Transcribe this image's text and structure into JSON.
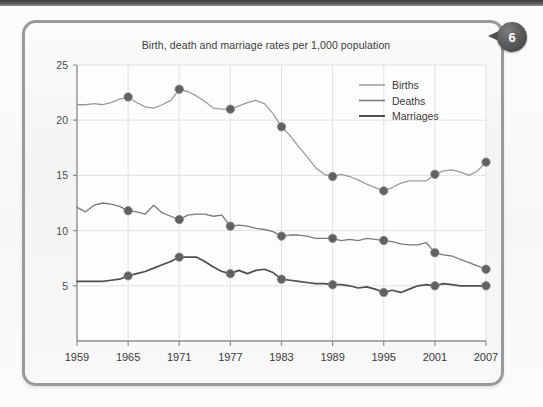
{
  "page": {
    "badge_number": "6",
    "badge_name": "figure-number-badge"
  },
  "chart_data": {
    "type": "line",
    "title": "Birth, death and marriage rates per 1,000 population",
    "xlabel": "",
    "ylabel": "",
    "xlim": [
      1959,
      2007
    ],
    "ylim": [
      0,
      25
    ],
    "yticks": [
      5,
      10,
      15,
      20,
      25
    ],
    "xticks": [
      1959,
      1965,
      1971,
      1977,
      1983,
      1989,
      1995,
      2001,
      2007
    ],
    "grid": true,
    "legend_position": "top-right",
    "marker_years": [
      1965,
      1971,
      1977,
      1983,
      1989,
      1995,
      2001,
      2007
    ],
    "colors": {
      "births": "#9b9b9b",
      "deaths": "#7a7a7a",
      "marriages": "#4f4f4f",
      "marker": "#616161",
      "grid": "#e2e2e2",
      "axis": "#8f8f8f"
    },
    "series": [
      {
        "name": "Births",
        "key": "births",
        "x": [
          1959,
          1960,
          1961,
          1962,
          1963,
          1964,
          1965,
          1966,
          1967,
          1968,
          1969,
          1970,
          1971,
          1972,
          1973,
          1974,
          1975,
          1976,
          1977,
          1978,
          1979,
          1980,
          1981,
          1982,
          1983,
          1984,
          1985,
          1986,
          1987,
          1988,
          1989,
          1990,
          1991,
          1992,
          1993,
          1994,
          1995,
          1996,
          1997,
          1998,
          1999,
          2000,
          2001,
          2002,
          2003,
          2004,
          2005,
          2006,
          2007
        ],
        "values": [
          21.4,
          21.4,
          21.5,
          21.4,
          21.6,
          21.9,
          22.1,
          21.6,
          21.2,
          21.1,
          21.4,
          21.8,
          22.8,
          22.6,
          22.2,
          21.7,
          21.1,
          21.0,
          21.0,
          21.3,
          21.6,
          21.8,
          21.5,
          20.6,
          19.4,
          18.6,
          17.6,
          16.7,
          15.7,
          15.1,
          14.9,
          15.1,
          14.9,
          14.6,
          14.2,
          13.9,
          13.6,
          13.9,
          14.3,
          14.5,
          14.5,
          14.5,
          15.1,
          15.4,
          15.5,
          15.3,
          15.0,
          15.4,
          16.2
        ]
      },
      {
        "name": "Deaths",
        "key": "deaths",
        "x": [
          1959,
          1960,
          1961,
          1962,
          1963,
          1964,
          1965,
          1966,
          1967,
          1968,
          1969,
          1970,
          1971,
          1972,
          1973,
          1974,
          1975,
          1976,
          1977,
          1978,
          1979,
          1980,
          1981,
          1982,
          1983,
          1984,
          1985,
          1986,
          1987,
          1988,
          1989,
          1990,
          1991,
          1992,
          1993,
          1994,
          1995,
          1996,
          1997,
          1998,
          1999,
          2000,
          2001,
          2002,
          2003,
          2004,
          2005,
          2006,
          2007
        ],
        "values": [
          12.1,
          11.7,
          12.3,
          12.5,
          12.4,
          12.2,
          11.8,
          11.7,
          11.5,
          12.3,
          11.6,
          11.3,
          11.0,
          11.4,
          11.5,
          11.5,
          11.3,
          11.4,
          10.4,
          10.5,
          10.4,
          10.2,
          10.1,
          9.9,
          9.5,
          9.6,
          9.6,
          9.5,
          9.3,
          9.3,
          9.3,
          9.1,
          9.2,
          9.1,
          9.3,
          9.2,
          9.1,
          9.0,
          8.8,
          8.7,
          8.7,
          8.9,
          8.0,
          7.8,
          7.7,
          7.4,
          7.1,
          6.8,
          6.5
        ]
      },
      {
        "name": "Marriages",
        "key": "marriages",
        "x": [
          1959,
          1960,
          1961,
          1962,
          1963,
          1964,
          1965,
          1966,
          1967,
          1968,
          1969,
          1970,
          1971,
          1972,
          1973,
          1974,
          1975,
          1976,
          1977,
          1978,
          1979,
          1980,
          1981,
          1982,
          1983,
          1984,
          1985,
          1986,
          1987,
          1988,
          1989,
          1990,
          1991,
          1992,
          1993,
          1994,
          1995,
          1996,
          1997,
          1998,
          1999,
          2000,
          2001,
          2002,
          2003,
          2004,
          2005,
          2006,
          2007
        ],
        "values": [
          5.4,
          5.4,
          5.4,
          5.4,
          5.5,
          5.6,
          5.9,
          6.1,
          6.3,
          6.6,
          6.9,
          7.2,
          7.6,
          7.6,
          7.6,
          7.2,
          6.7,
          6.3,
          6.1,
          6.4,
          6.1,
          6.4,
          6.5,
          6.2,
          5.6,
          5.5,
          5.4,
          5.3,
          5.2,
          5.2,
          5.1,
          5.1,
          5.0,
          4.8,
          4.9,
          4.7,
          4.4,
          4.6,
          4.4,
          4.7,
          5.0,
          5.1,
          5.0,
          5.2,
          5.1,
          5.0,
          5.0,
          5.0,
          5.0
        ]
      }
    ],
    "legend": [
      {
        "label": "Births",
        "key": "births"
      },
      {
        "label": "Deaths",
        "key": "deaths"
      },
      {
        "label": "Marriages",
        "key": "marriages"
      }
    ]
  }
}
